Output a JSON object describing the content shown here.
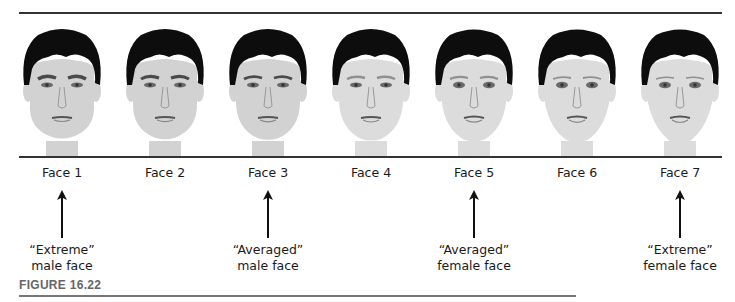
{
  "figure": {
    "label": "FIGURE 16.22",
    "faces": [
      {
        "label": "Face 1",
        "type": "male",
        "masculinity": 1.0
      },
      {
        "label": "Face 2",
        "type": "male",
        "masculinity": 0.67
      },
      {
        "label": "Face 3",
        "type": "male",
        "masculinity": 0.33
      },
      {
        "label": "Face 4",
        "type": "neutral",
        "masculinity": 0.0
      },
      {
        "label": "Face 5",
        "type": "female",
        "masculinity": -0.33
      },
      {
        "label": "Face 6",
        "type": "female",
        "masculinity": -0.67
      },
      {
        "label": "Face 7",
        "type": "female",
        "masculinity": -1.0
      }
    ],
    "annotations": [
      {
        "face_index": 0,
        "line1": "“Extreme”",
        "line2": "male face"
      },
      {
        "face_index": 2,
        "line1": "“Averaged”",
        "line2": "male face"
      },
      {
        "face_index": 4,
        "line1": "“Averaged”",
        "line2": "female face"
      },
      {
        "face_index": 6,
        "line1": "“Extreme”",
        "line2": "female face"
      }
    ]
  },
  "colors": {
    "hair": "#0d0d0d",
    "skin": "#d8d8d8",
    "feature": "#6a6a6a",
    "rule": "#333333"
  }
}
